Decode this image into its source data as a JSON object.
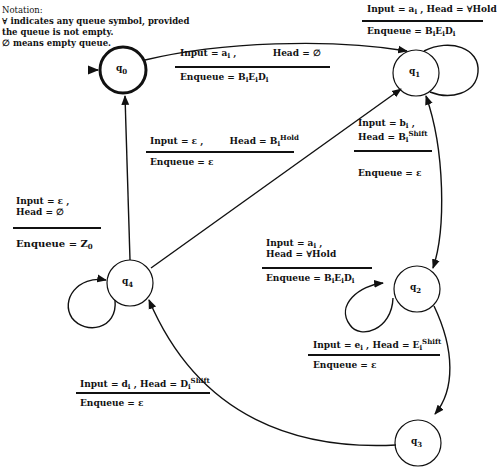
{
  "notation": {
    "title": "Notation:",
    "lines": [
      "∀ indicates any queue symbol, provided",
      "the queue is not empty.",
      "∅ means empty queue."
    ]
  },
  "states": [
    {
      "id": "q0",
      "label": "q",
      "sub": "0",
      "initial": true
    },
    {
      "id": "q1",
      "label": "q",
      "sub": "1"
    },
    {
      "id": "q2",
      "label": "q",
      "sub": "2"
    },
    {
      "id": "q3",
      "label": "q",
      "sub": "3"
    },
    {
      "id": "q4",
      "label": "q",
      "sub": "4"
    }
  ],
  "transitions": [
    {
      "from": "q0",
      "to": "q1",
      "input": "a",
      "input_sub": "i",
      "head": "∅",
      "head_sub": "",
      "head_sup": "",
      "enqueue": "B",
      "enqueue_parts": [
        "B",
        "i",
        "E",
        "i",
        "D",
        "i"
      ]
    },
    {
      "from": "q1",
      "to": "q1",
      "input": "a",
      "input_sub": "i",
      "head": "∀",
      "head_sup": "Hold",
      "enqueue_parts": [
        "B",
        "i",
        "E",
        "i",
        "D",
        "i"
      ]
    },
    {
      "from": "q1",
      "to": "q2",
      "input": "b",
      "input_sub": "i",
      "head": "B",
      "head_sub": "i",
      "head_sup": "Shift",
      "enqueue": "ε"
    },
    {
      "from": "q2",
      "to": "q2",
      "input": "a",
      "input_sub": "i",
      "head": "∀",
      "head_sup": "Hold",
      "enqueue_parts": [
        "B",
        "i",
        "E",
        "i",
        "D",
        "i"
      ]
    },
    {
      "from": "q2",
      "to": "q3",
      "input": "e",
      "input_sub": "i",
      "head": "E",
      "head_sub": "i",
      "head_sup": "Shift",
      "enqueue": "ε"
    },
    {
      "from": "q3",
      "to": "q4",
      "input": "d",
      "input_sub": "i",
      "head": "D",
      "head_sub": "i",
      "head_sup": "Shift",
      "enqueue": "ε"
    },
    {
      "from": "q4",
      "to": "q1",
      "input": "ε",
      "input_sub": "",
      "head": "B",
      "head_sub": "i",
      "head_sup": "Hold",
      "enqueue": "ε"
    },
    {
      "from": "q4",
      "to": "q0",
      "input": "ε",
      "input_sub": "",
      "head": "∅",
      "enqueue": "Z",
      "enqueue_sub": "0"
    }
  ],
  "text": {
    "input_eq": "Input = ",
    "head_eq": "Head = ",
    "enqueue_eq": "Enqueue = ",
    "comma": " ,",
    "eps": "ε",
    "empty": "∅",
    "any": "∀",
    "hold": "Hold",
    "shift": "Shift",
    "i": "i",
    "zero": "0",
    "q": "q",
    "a": "a",
    "b": "b",
    "d": "d",
    "e": "e",
    "B": "B",
    "D": "D",
    "E": "E",
    "Z": "Z"
  }
}
